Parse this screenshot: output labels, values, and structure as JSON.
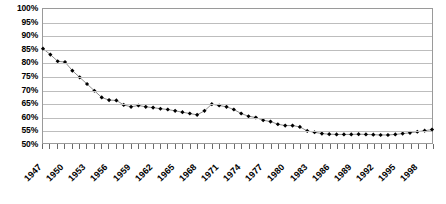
{
  "chart_data": {
    "type": "line",
    "title": "",
    "subtitle": "",
    "xlabel": "",
    "ylabel": "",
    "ylim": [
      50,
      100
    ],
    "ytick_step": 5,
    "ytick_labels": [
      "100%",
      "95%",
      "90%",
      "85%",
      "80%",
      "75%",
      "70%",
      "65%",
      "60%",
      "55%",
      "50%"
    ],
    "ytick_values": [
      100,
      95,
      90,
      85,
      80,
      75,
      70,
      65,
      60,
      55,
      50
    ],
    "xlim": [
      1947,
      2000
    ],
    "xtick_labels": [
      "1947",
      "1950",
      "1953",
      "1956",
      "1959",
      "1962",
      "1965",
      "1968",
      "1971",
      "1974",
      "1977",
      "1980",
      "1983",
      "1986",
      "1989",
      "1992",
      "1995",
      "1998"
    ],
    "xtick_values": [
      1947,
      1950,
      1953,
      1956,
      1959,
      1962,
      1965,
      1968,
      1971,
      1974,
      1977,
      1980,
      1983,
      1986,
      1989,
      1992,
      1995,
      1998
    ],
    "xtick_minor_step": 1,
    "grid": "horizontal",
    "legend": "none",
    "marker": "filled-diamond",
    "line_color": "#808080",
    "marker_color": "#000000",
    "x": [
      1947,
      1948,
      1949,
      1950,
      1951,
      1952,
      1953,
      1954,
      1955,
      1956,
      1957,
      1958,
      1959,
      1960,
      1961,
      1962,
      1963,
      1964,
      1965,
      1966,
      1967,
      1968,
      1969,
      1970,
      1971,
      1972,
      1973,
      1974,
      1975,
      1976,
      1977,
      1978,
      1979,
      1980,
      1981,
      1982,
      1983,
      1984,
      1985,
      1986,
      1987,
      1988,
      1989,
      1990,
      1991,
      1992,
      1993,
      1994,
      1995,
      1996,
      1997,
      1998,
      1999,
      2000
    ],
    "values": [
      85.2,
      83.0,
      80.5,
      80.2,
      77.0,
      74.5,
      72.0,
      69.5,
      67.0,
      66.0,
      65.9,
      64.2,
      63.5,
      64.0,
      63.5,
      63.2,
      62.8,
      62.5,
      62.0,
      61.5,
      61.0,
      60.5,
      62.0,
      64.5,
      64.0,
      63.5,
      62.5,
      61.0,
      60.0,
      59.5,
      58.5,
      58.0,
      57.0,
      56.5,
      56.5,
      56.0,
      54.5,
      54.0,
      53.5,
      53.3,
      53.2,
      53.2,
      53.2,
      53.3,
      53.2,
      53.1,
      53.0,
      53.0,
      53.2,
      53.5,
      53.8,
      54.2,
      54.6,
      55.0
    ],
    "series_name": ""
  },
  "caption": {
    "text": ""
  }
}
